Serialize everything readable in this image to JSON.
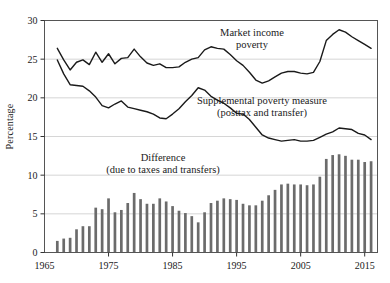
{
  "chart_data": {
    "type": "line",
    "title": "",
    "xlabel": "",
    "ylabel": "Percentage",
    "xlim": [
      1965,
      2017
    ],
    "ylim": [
      0,
      30
    ],
    "xticks": [
      1965,
      1975,
      1985,
      1995,
      2005,
      2015
    ],
    "yticks": [
      0,
      5,
      10,
      15,
      20,
      25,
      30
    ],
    "grid": "horizontal",
    "legend_position": "inline-annotations",
    "annotations": [
      {
        "name": "market-income-poverty-label",
        "line1": "Market income",
        "line2": "poverty"
      },
      {
        "name": "supplemental-poverty-measure-label",
        "line1": "Supplemental poverty measure",
        "line2": "(posttax and transfer)"
      },
      {
        "name": "difference-label",
        "line1": "Difference",
        "line2": "(due to taxes and transfers)"
      }
    ],
    "colors": {
      "line": "#1a1a1a",
      "bar": "#6b6b6b",
      "grid": "#cccccc",
      "frame": "#555555"
    },
    "x": [
      1967,
      1968,
      1969,
      1970,
      1971,
      1972,
      1973,
      1974,
      1975,
      1976,
      1977,
      1978,
      1979,
      1980,
      1981,
      1982,
      1983,
      1984,
      1985,
      1986,
      1987,
      1988,
      1989,
      1990,
      1991,
      1992,
      1993,
      1994,
      1995,
      1996,
      1997,
      1998,
      1999,
      2000,
      2001,
      2002,
      2003,
      2004,
      2005,
      2006,
      2007,
      2008,
      2009,
      2010,
      2011,
      2012,
      2013,
      2014,
      2015,
      2016
    ],
    "series": [
      {
        "name": "Market income poverty",
        "type": "line",
        "values": [
          26.4,
          24.9,
          23.6,
          24.6,
          24.9,
          24.3,
          25.9,
          24.6,
          25.7,
          24.4,
          25.1,
          25.2,
          26.3,
          25.3,
          24.5,
          24.2,
          24.4,
          23.9,
          23.9,
          24.0,
          24.6,
          25.0,
          25.2,
          26.2,
          26.6,
          26.4,
          26.3,
          25.6,
          24.8,
          24.2,
          23.3,
          22.3,
          21.9,
          22.2,
          22.7,
          23.2,
          23.4,
          23.4,
          23.2,
          23.1,
          23.3,
          24.7,
          27.4,
          28.2,
          28.8,
          28.5,
          27.9,
          27.4,
          26.9,
          26.4
        ]
      },
      {
        "name": "Supplemental poverty measure (posttax and transfer)",
        "type": "line",
        "values": [
          24.9,
          23.1,
          21.7,
          21.6,
          21.5,
          20.9,
          20.1,
          19.0,
          18.7,
          19.2,
          19.6,
          18.8,
          18.6,
          18.4,
          18.2,
          17.9,
          17.4,
          17.3,
          17.9,
          18.6,
          19.5,
          20.3,
          21.3,
          21.0,
          20.2,
          19.7,
          19.3,
          18.7,
          18.0,
          17.9,
          17.2,
          16.2,
          15.2,
          14.8,
          14.6,
          14.4,
          14.5,
          14.6,
          14.4,
          14.4,
          14.5,
          14.9,
          15.3,
          15.6,
          16.1,
          16.0,
          15.9,
          15.4,
          15.2,
          14.6
        ]
      },
      {
        "name": "Difference (due to taxes and transfers)",
        "type": "bar",
        "values": [
          1.5,
          1.8,
          1.9,
          3.0,
          3.4,
          3.4,
          5.8,
          5.6,
          7.0,
          5.2,
          5.5,
          6.4,
          7.7,
          6.9,
          6.3,
          6.3,
          7.0,
          6.6,
          6.0,
          5.4,
          5.1,
          4.7,
          3.9,
          5.2,
          6.4,
          6.7,
          7.0,
          6.9,
          6.8,
          6.3,
          6.1,
          6.1,
          6.7,
          7.4,
          8.1,
          8.8,
          8.9,
          8.8,
          8.8,
          8.7,
          8.8,
          9.8,
          12.1,
          12.6,
          12.7,
          12.5,
          12.0,
          12.0,
          11.7,
          11.8
        ]
      }
    ]
  }
}
